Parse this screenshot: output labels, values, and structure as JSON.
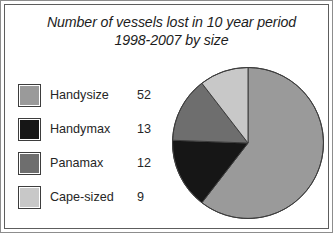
{
  "chart_data": {
    "type": "pie",
    "title": "Number of vessels lost in 10 year period 1998-2007 by size",
    "title_line_1": "Number of vessels lost in 10 year period",
    "title_line_2": "1998-2007 by size",
    "categories": [
      "Handysize",
      "Handymax",
      "Panamax",
      "Cape-sized"
    ],
    "values": [
      52,
      13,
      12,
      9
    ],
    "total": 86,
    "colors": [
      "#9a9a9a",
      "#161616",
      "#6e6e6e",
      "#c8c8c8"
    ],
    "slice_degrees": [
      217.7,
      54.4,
      50.2,
      37.7
    ],
    "start_angle_deg": 0,
    "direction": "clockwise",
    "legend_position": "left",
    "grid": false,
    "xlabel": "",
    "ylabel": "",
    "slices": [
      {
        "label": "Handysize",
        "value": 52,
        "color": "#9a9a9a",
        "percent": 60.5
      },
      {
        "label": "Handymax",
        "value": 13,
        "color": "#161616",
        "percent": 15.1
      },
      {
        "label": "Panamax",
        "value": 12,
        "color": "#6e6e6e",
        "percent": 14.0
      },
      {
        "label": "Cape-sized",
        "value": 9,
        "color": "#c8c8c8",
        "percent": 10.5
      }
    ]
  },
  "frame": {
    "outer_border_color": "#8d8d8d",
    "inner_border_color": "#5d5d5d",
    "background": "#ffffff"
  }
}
